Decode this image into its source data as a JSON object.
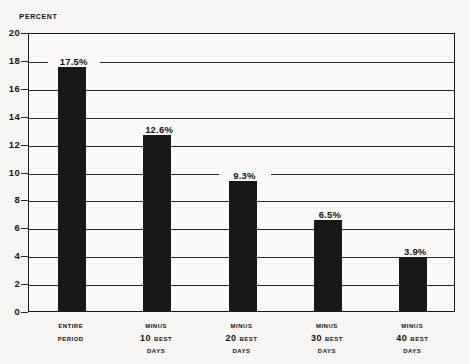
{
  "chart_data": {
    "type": "bar",
    "title": "",
    "ylabel": "Percent",
    "xlabel": "",
    "ylim": [
      0,
      20
    ],
    "ytick_step": 2,
    "grid": true,
    "legend": "none",
    "bar_color": "#191715",
    "categories": [
      "Entire Period",
      "Minus 10 Best Days",
      "Minus 20 Best Days",
      "Minus 30 Best Days",
      "Minus 40 Best Days"
    ],
    "category_lines": [
      [
        "Entire",
        "Period"
      ],
      [
        "Minus",
        "10 Best",
        "Days"
      ],
      [
        "Minus",
        "20 Best",
        "Days"
      ],
      [
        "Minus",
        "30 Best",
        "Days"
      ],
      [
        "Minus",
        "40 Best",
        "Days"
      ]
    ],
    "values": [
      17.5,
      12.6,
      9.3,
      6.5,
      3.9
    ],
    "value_labels": [
      "17.5%",
      "12.6%",
      "9.3%",
      "6.5%",
      "3.9%"
    ],
    "yticks": [
      "20",
      "18",
      "16",
      "14",
      "12",
      "10",
      "8",
      "6",
      "4",
      "2",
      "0"
    ]
  }
}
